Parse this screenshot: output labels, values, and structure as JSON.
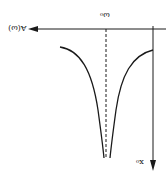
{
  "figure": {
    "orientation": "rotated-180",
    "labels": {
      "vertical_axis": "A(ω)",
      "center_frequency": "ω₀",
      "horizontal_axis": "x₀"
    },
    "colors": {
      "stroke": "#1a1a1a",
      "background": "#ffffff"
    },
    "curve": "symmetric V-shaped dip (absorption line) centered at ω₀",
    "center_marker": "dashed vertical line at ω₀"
  }
}
